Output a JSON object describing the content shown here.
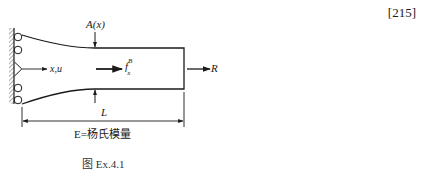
{
  "page_reference": "[215]",
  "diagram": {
    "labels": {
      "area": "A(x)",
      "coordinate": "x,u",
      "body_force_base": "f",
      "body_force_sup": "B",
      "body_force_sub": "x",
      "end_load": "R",
      "length": "L",
      "material": "E=杨氏模量"
    },
    "caption": "图 Ex.4.1",
    "colors": {
      "line": "#1a1a1a",
      "hatch": "#555555",
      "background": "#ffffff"
    }
  }
}
